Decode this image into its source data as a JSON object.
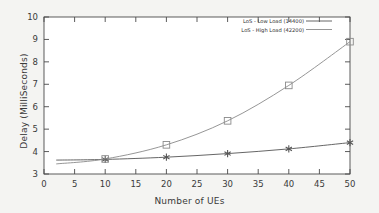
{
  "chart_data": {
    "type": "line",
    "title": "",
    "xlabel": "Number of UEs",
    "ylabel": "Delay (MilliSeconds)",
    "xlim": [
      0,
      50
    ],
    "ylim": [
      3,
      10
    ],
    "xticks": [
      0,
      5,
      10,
      15,
      20,
      25,
      30,
      35,
      40,
      45,
      50
    ],
    "yticks": [
      3,
      4,
      5,
      6,
      7,
      8,
      9,
      10
    ],
    "grid": false,
    "legend_position": "top-right",
    "series": [
      {
        "name": "LoS - Low Load (14400)",
        "marker": "asterisk",
        "color": "#555555",
        "x": [
          2,
          10,
          20,
          30,
          40,
          50
        ],
        "values": [
          3.62,
          3.65,
          3.75,
          3.91,
          4.12,
          4.4
        ]
      },
      {
        "name": "LoS - High Load (42200)",
        "marker": "square",
        "color": "#8a8a8a",
        "x": [
          2,
          10,
          20,
          30,
          40,
          50
        ],
        "values": [
          3.45,
          3.67,
          4.3,
          5.37,
          6.95,
          8.9
        ]
      }
    ]
  },
  "axes": {
    "x_tick_labels": [
      "0",
      "5",
      "10",
      "15",
      "20",
      "25",
      "30",
      "35",
      "40",
      "45",
      "50"
    ],
    "y_tick_labels": [
      "3",
      "4",
      "5",
      "6",
      "7",
      "8",
      "9",
      "10"
    ]
  },
  "legend": {
    "entries": [
      {
        "label": "LoS - Low Load (14400)"
      },
      {
        "label": "LoS - High Load (42200)"
      }
    ]
  }
}
